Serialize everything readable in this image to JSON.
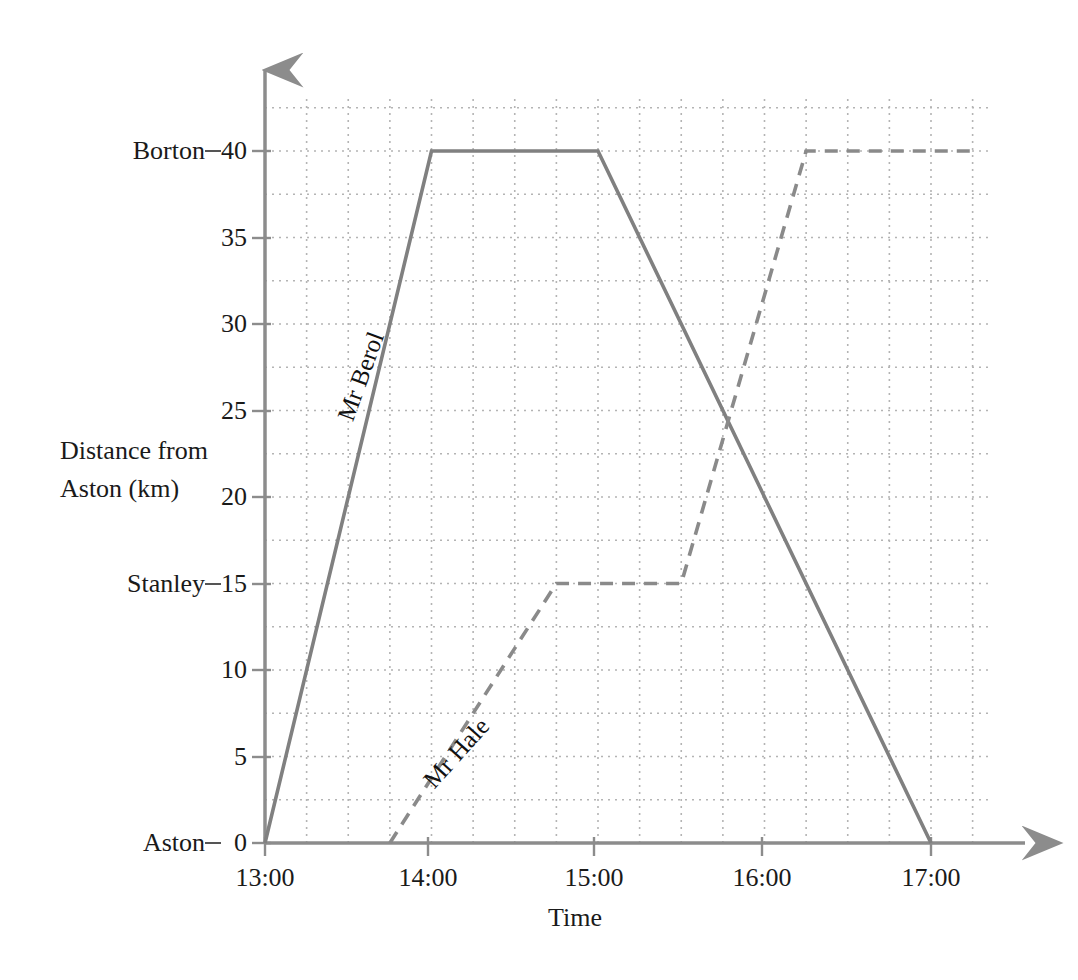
{
  "chart_data": {
    "type": "line",
    "title": "",
    "xlabel": "Time",
    "ylabel": "Distance from Aston (km)",
    "ylabel_lines": [
      "Distance from",
      "Aston (km)"
    ],
    "xlim": [
      "13:00",
      "17:15"
    ],
    "ylim": [
      0,
      43
    ],
    "grid": true,
    "grid_x_step_minutes": 15,
    "grid_y_step": 2.5,
    "legend": "inline-labels",
    "x_tick_labels": [
      "13:00",
      "14:00",
      "15:00",
      "16:00",
      "17:00"
    ],
    "x_tick_values": [
      13.0,
      14.0,
      15.0,
      16.0,
      17.0
    ],
    "y_tick_labels": [
      "0",
      "5",
      "10",
      "15",
      "20",
      "25",
      "30",
      "35",
      "40"
    ],
    "y_tick_values": [
      0,
      5,
      10,
      15,
      20,
      25,
      30,
      35,
      40
    ],
    "station_labels": [
      {
        "name": "Aston",
        "value": 0,
        "tick_text": "0"
      },
      {
        "name": "Stanley",
        "value": 15,
        "tick_text": "15"
      },
      {
        "name": "Borton",
        "value": 40,
        "tick_text": "40"
      }
    ],
    "series": [
      {
        "name": "Mr Berol",
        "style": "solid",
        "color": "#808080",
        "label_rotation_deg": -70,
        "points": [
          {
            "time": "13:00",
            "t": 13.0,
            "distance": 0
          },
          {
            "time": "14:00",
            "t": 14.0,
            "distance": 40
          },
          {
            "time": "15:00",
            "t": 15.0,
            "distance": 40
          },
          {
            "time": "17:00",
            "t": 17.0,
            "distance": 0
          }
        ]
      },
      {
        "name": "Mr Hale",
        "style": "dashed",
        "color": "#8a8a8a",
        "label_rotation_deg": -48,
        "points": [
          {
            "time": "13:45",
            "t": 13.75,
            "distance": 0
          },
          {
            "time": "14:45",
            "t": 14.75,
            "distance": 15
          },
          {
            "time": "15:30",
            "t": 15.5,
            "distance": 15
          },
          {
            "time": "16:15",
            "t": 16.25,
            "distance": 40
          },
          {
            "time": "17:15",
            "t": 17.25,
            "distance": 40
          }
        ]
      }
    ],
    "annotations": [
      {
        "text": "Mr Berol",
        "at_time": "13:35",
        "at_distance": 27
      },
      {
        "text": "Mr Hale",
        "at_time": "14:20",
        "at_distance": 8
      }
    ]
  },
  "axes": {
    "x_axis_name": "time-axis",
    "y_axis_name": "distance-axis",
    "x_axis_label": "Time",
    "y_axis_label_line1": "Distance from",
    "y_axis_label_line2": "Aston (km)"
  },
  "colors": {
    "grid": "#b4b4b4",
    "axis": "#8c8c8c",
    "series_berol": "#808080",
    "series_hale": "#8a8a8a",
    "text": "#1a1a1a",
    "background": "#ffffff"
  },
  "ticks": {
    "x": [
      {
        "label": "13:00",
        "x": 265
      },
      {
        "label": "14:00",
        "x": 428
      },
      {
        "label": "15:00",
        "x": 594
      },
      {
        "label": "16:00",
        "x": 762
      },
      {
        "label": "17:00",
        "x": 931
      }
    ],
    "y": [
      {
        "label": "0",
        "y": 843
      },
      {
        "label": "5",
        "y": 757
      },
      {
        "label": "10",
        "y": 670
      },
      {
        "label": "15",
        "y": 584
      },
      {
        "label": "20",
        "y": 497
      },
      {
        "label": "25",
        "y": 411
      },
      {
        "label": "30",
        "y": 324
      },
      {
        "label": "35",
        "y": 238
      },
      {
        "label": "40",
        "y": 151
      }
    ]
  },
  "stations": [
    {
      "label": "Borton",
      "y": 151
    },
    {
      "label": "Stanley",
      "y": 584
    },
    {
      "label": "Aston",
      "y": 843
    }
  ]
}
